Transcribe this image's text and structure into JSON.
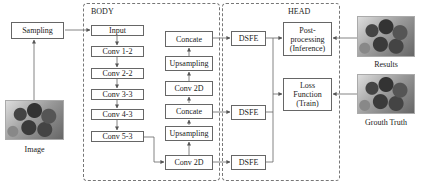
{
  "diagram": {
    "regions": {
      "body": "BODY",
      "head": "HEAD"
    },
    "nodes": {
      "sampling": "Sampling",
      "input": "Input",
      "conv1_2": "Conv 1-2",
      "conv2_2": "Conv 2-2",
      "conv3_3": "Conv 3-3",
      "conv4_3": "Conv 4-3",
      "conv5_3": "Conv 5-3",
      "concate_top": "Concate",
      "upsampling_top": "Upsampling",
      "conv2d_mid": "Conv 2D",
      "concate_mid": "Concate",
      "upsampling_bottom": "Upsampling",
      "conv2d_bottom": "Conv 2D",
      "dsfe_top": "DSFE",
      "dsfe_mid": "DSFE",
      "dsfe_bottom": "DSFE",
      "postprocessing_l1": "Post-",
      "postprocessing_l2": "processing",
      "postprocessing_l3": "(Inference)",
      "loss_l1": "Loss",
      "loss_l2": "Function",
      "loss_l3": "(Train)"
    },
    "images": {
      "input_image": "Image",
      "results": "Results",
      "ground_truth": "Grouth Truth"
    },
    "edges": [
      [
        "Image",
        "Sampling"
      ],
      [
        "Sampling",
        "Input"
      ],
      [
        "Input",
        "Conv 1-2"
      ],
      [
        "Conv 1-2",
        "Conv 2-2"
      ],
      [
        "Conv 2-2",
        "Conv 3-3"
      ],
      [
        "Conv 3-3",
        "Conv 4-3"
      ],
      [
        "Conv 4-3",
        "Conv 5-3"
      ],
      [
        "Conv 5-3",
        "Conv 2D (bottom)"
      ],
      [
        "Conv 2D (bottom)",
        "Upsampling (bottom)"
      ],
      [
        "Upsampling (bottom)",
        "Concate (mid)"
      ],
      [
        "Concate (mid)",
        "Conv 2D (mid)"
      ],
      [
        "Conv 2D (mid)",
        "Upsampling (top)"
      ],
      [
        "Upsampling (top)",
        "Concate (top)"
      ],
      [
        "Concate (top)",
        "DSFE (top)"
      ],
      [
        "Concate (mid)",
        "DSFE (mid)"
      ],
      [
        "Conv 2D (bottom)",
        "DSFE (bottom)"
      ],
      [
        "DSFE",
        "Post-processing (Inference)"
      ],
      [
        "DSFE",
        "Loss Function (Train)"
      ],
      [
        "Results",
        "Post-processing (Inference)"
      ],
      [
        "Grouth Truth",
        "Loss Function (Train)"
      ]
    ]
  }
}
